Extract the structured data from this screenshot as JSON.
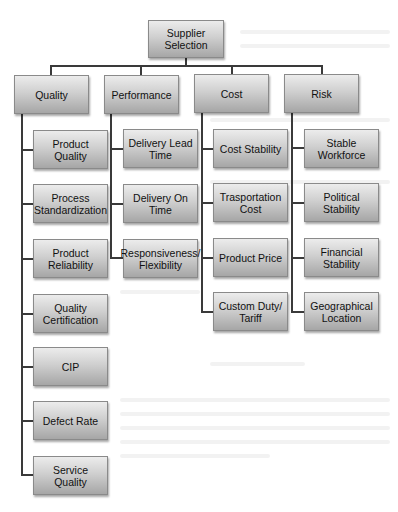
{
  "diagram": {
    "root": {
      "label": "Supplier Selection"
    },
    "categories": [
      {
        "label": "Quality",
        "children": [
          {
            "label": "Product Quality"
          },
          {
            "label": "Process Standardization"
          },
          {
            "label": "Product Reliability"
          },
          {
            "label": "Quality Certification"
          },
          {
            "label": "CIP"
          },
          {
            "label": "Defect Rate"
          },
          {
            "label": "Service Quality"
          }
        ]
      },
      {
        "label": "Performance",
        "children": [
          {
            "label": "Delivery Lead Time"
          },
          {
            "label": "Delivery On Time"
          },
          {
            "label": "Responsiveness/ Flexibility"
          }
        ]
      },
      {
        "label": "Cost",
        "children": [
          {
            "label": "Cost Stability"
          },
          {
            "label": "Trasportation Cost"
          },
          {
            "label": "Product Price"
          },
          {
            "label": "Custom Duty/ Tariff"
          }
        ]
      },
      {
        "label": "Risk",
        "children": [
          {
            "label": "Stable Workforce"
          },
          {
            "label": "Political Stability"
          },
          {
            "label": "Financial Stability"
          },
          {
            "label": "Geographical Location"
          }
        ]
      }
    ],
    "colors": {
      "box_top": "#ececec",
      "box_bottom": "#a6a6a6",
      "connector": "#3a3a3a",
      "background": "#ffffff"
    }
  }
}
